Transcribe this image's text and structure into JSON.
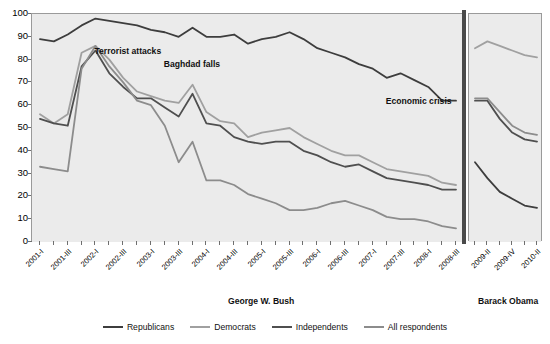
{
  "chart_data": {
    "type": "line",
    "title": "",
    "xlabel": "",
    "ylabel": "",
    "ylim": [
      0,
      100
    ],
    "ytick_values": [
      0,
      10,
      20,
      30,
      40,
      50,
      60,
      70,
      80,
      90,
      100
    ],
    "grid": "horizontal alternating gray bands every 10 units",
    "legend_position": "bottom-center",
    "panels": [
      {
        "name": "George W. Bush",
        "x": [
          "2001-I",
          "2001-II",
          "2001-III",
          "2001-IV",
          "2002-I",
          "2002-II",
          "2002-III",
          "2002-IV",
          "2003-I",
          "2003-II",
          "2003-III",
          "2003-IV",
          "2004-I",
          "2004-II",
          "2004-III",
          "2004-IV",
          "2005-I",
          "2005-II",
          "2005-III",
          "2005-IV",
          "2006-I",
          "2006-II",
          "2006-III",
          "2006-IV",
          "2007-I",
          "2007-II",
          "2007-III",
          "2007-IV",
          "2008-I",
          "2008-II",
          "2008-III"
        ],
        "xtick_labels": [
          "2001-I",
          "",
          "2001-III",
          "",
          "2002-I",
          "",
          "2002-III",
          "",
          "2003-I",
          "",
          "2003-III",
          "",
          "2004-I",
          "",
          "2004-III",
          "",
          "2005-I",
          "",
          "2005-III",
          "",
          "2006-I",
          "",
          "2006-III",
          "",
          "2007-I",
          "",
          "2007-III",
          "",
          "2008-I",
          "",
          "2008-III"
        ],
        "series": [
          {
            "name": "Republicans",
            "values": [
              89,
              88,
              91,
              95,
              98,
              97,
              96,
              95,
              93,
              92,
              90,
              94,
              90,
              90,
              91,
              87,
              89,
              90,
              92,
              89,
              85,
              83,
              81,
              78,
              76,
              72,
              74,
              71,
              68,
              62,
              62
            ]
          },
          {
            "name": "Democrats",
            "values": [
              56,
              52,
              56,
              83,
              86,
              80,
              72,
              66,
              64,
              62,
              61,
              69,
              57,
              53,
              52,
              46,
              48,
              49,
              50,
              46,
              43,
              40,
              38,
              38,
              35,
              32,
              31,
              30,
              29,
              26,
              25
            ]
          },
          {
            "name": "Independents",
            "values": [
              54,
              52,
              51,
              77,
              84,
              74,
              68,
              63,
              63,
              59,
              55,
              65,
              52,
              51,
              46,
              44,
              43,
              44,
              44,
              40,
              38,
              35,
              33,
              34,
              31,
              28,
              27,
              26,
              25,
              23,
              23
            ]
          },
          {
            "name": "All respondents",
            "values": [
              33,
              32,
              31,
              76,
              86,
              77,
              70,
              62,
              60,
              51,
              35,
              44,
              27,
              27,
              25,
              21,
              19,
              17,
              14,
              14,
              15,
              17,
              18,
              16,
              14,
              11,
              10,
              10,
              9,
              7,
              6
            ]
          }
        ]
      },
      {
        "name": "Barack Obama",
        "x": [
          "2009-I",
          "2009-II",
          "2009-III",
          "2009-IV",
          "2010-I",
          "2010-II"
        ],
        "xtick_labels": [
          "",
          "2009-II",
          "",
          "2009-IV",
          "",
          "2010-II"
        ],
        "series": [
          {
            "name": "Republicans",
            "values": [
              35,
              28,
              22,
              19,
              16,
              15
            ]
          },
          {
            "name": "Democrats",
            "values": [
              85,
              88,
              86,
              84,
              82,
              81
            ]
          },
          {
            "name": "Independents",
            "values": [
              62,
              62,
              54,
              48,
              45,
              44
            ]
          },
          {
            "name": "All respondents",
            "values": [
              63,
              63,
              57,
              51,
              48,
              47
            ]
          }
        ]
      }
    ],
    "annotations": [
      {
        "text": "Terrorist attacks",
        "x_pos": "2002-I",
        "y_pos": 83
      },
      {
        "text": "Baghdad falls",
        "x_pos": "2003-II",
        "y_pos": 77
      },
      {
        "text": "Economic crisis",
        "x_pos": "2007-II",
        "y_pos": 61
      }
    ],
    "series_colors": {
      "Republicans": "#3d3d3d",
      "Democrats": "#a0a0a0",
      "Independents": "#4f4f4f",
      "All respondents": "#8c8c8c"
    },
    "legend": [
      {
        "label": "Republicans",
        "color": "#3d3d3d"
      },
      {
        "label": "Democrats",
        "color": "#a0a0a0"
      },
      {
        "label": "Independents",
        "color": "#4f4f4f"
      },
      {
        "label": "All respondents",
        "color": "#8c8c8c"
      }
    ],
    "period_labels": [
      "George W. Bush",
      "Barack Obama"
    ],
    "band_color": "#ebebeb",
    "axis_color": "#6f6f6f",
    "divider_color": "#4a4a4a"
  }
}
